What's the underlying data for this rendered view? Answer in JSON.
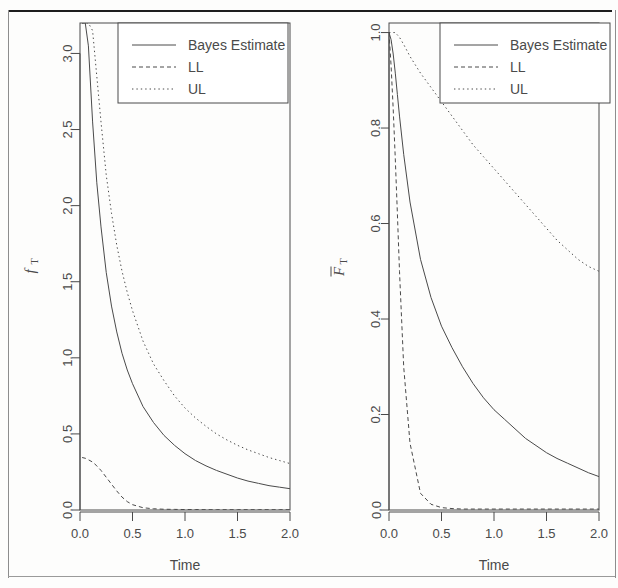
{
  "figure": {
    "kind": "two-panel-statistical-figure",
    "background": "#fdfdfc",
    "ink": "#4a4a4a",
    "panel_count": 2
  },
  "legend": {
    "entries": [
      {
        "label": "Bayes Estimate",
        "style": "solid"
      },
      {
        "label": "LL",
        "style": "dashed"
      },
      {
        "label": "UL",
        "style": "dotted"
      }
    ]
  },
  "chart_data": [
    {
      "id": "left-panel",
      "type": "line",
      "title": "",
      "xlabel": "Time",
      "ylabel": "f_T",
      "ylabel_display": "fT",
      "xlim": [
        0.0,
        2.0
      ],
      "ylim": [
        0.0,
        3.2
      ],
      "xticks": [
        "0.0",
        "0.5",
        "1.0",
        "1.5",
        "2.0"
      ],
      "xtick_values": [
        0.0,
        0.5,
        1.0,
        1.5,
        2.0
      ],
      "yticks": [
        "0.0",
        "0.5",
        "1.0",
        "1.5",
        "2.0",
        "2.5",
        "3.0"
      ],
      "ytick_values": [
        0.0,
        0.5,
        1.0,
        1.5,
        2.0,
        2.5,
        3.0
      ],
      "grid": false,
      "legend_position": "top-right",
      "x": [
        0.02,
        0.05,
        0.08,
        0.12,
        0.16,
        0.2,
        0.25,
        0.3,
        0.35,
        0.4,
        0.45,
        0.5,
        0.6,
        0.7,
        0.8,
        0.9,
        1.0,
        1.1,
        1.2,
        1.3,
        1.4,
        1.5,
        1.6,
        1.7,
        1.8,
        1.9,
        2.0
      ],
      "series": [
        {
          "name": "Bayes Estimate",
          "style": "solid",
          "values": [
            3.2,
            3.2,
            3.05,
            2.55,
            2.15,
            1.86,
            1.56,
            1.34,
            1.17,
            1.03,
            0.92,
            0.83,
            0.68,
            0.575,
            0.49,
            0.425,
            0.37,
            0.325,
            0.29,
            0.26,
            0.235,
            0.21,
            0.19,
            0.175,
            0.16,
            0.15,
            0.14
          ]
        },
        {
          "name": "LL",
          "style": "dashed",
          "values": [
            0.345,
            0.34,
            0.33,
            0.315,
            0.29,
            0.26,
            0.215,
            0.17,
            0.125,
            0.085,
            0.055,
            0.035,
            0.015,
            0.008,
            0.005,
            0.004,
            0.003,
            0.003,
            0.002,
            0.002,
            0.002,
            0.002,
            0.002,
            0.002,
            0.002,
            0.002,
            0.002
          ]
        },
        {
          "name": "UL",
          "style": "dotted",
          "values": [
            3.2,
            3.2,
            3.2,
            3.15,
            2.85,
            2.55,
            2.2,
            1.95,
            1.74,
            1.57,
            1.43,
            1.31,
            1.11,
            0.96,
            0.85,
            0.75,
            0.67,
            0.605,
            0.55,
            0.5,
            0.46,
            0.425,
            0.395,
            0.37,
            0.345,
            0.325,
            0.305
          ]
        }
      ]
    },
    {
      "id": "right-panel",
      "type": "line",
      "title": "",
      "xlabel": "Time",
      "ylabel": "Fbar_T",
      "ylabel_display": "FT",
      "xlim": [
        0.0,
        2.0
      ],
      "ylim": [
        0.0,
        1.02
      ],
      "xticks": [
        "0.0",
        "0.5",
        "1.0",
        "1.5",
        "2.0"
      ],
      "xtick_values": [
        0.0,
        0.5,
        1.0,
        1.5,
        2.0
      ],
      "yticks": [
        "0.0",
        "0.2",
        "0.4",
        "0.6",
        "0.8",
        "1.0"
      ],
      "ytick_values": [
        0.0,
        0.2,
        0.4,
        0.6,
        0.8,
        1.0
      ],
      "grid": false,
      "legend_position": "top-right",
      "x": [
        0.0,
        0.02,
        0.04,
        0.06,
        0.08,
        0.1,
        0.14,
        0.2,
        0.3,
        0.4,
        0.5,
        0.6,
        0.7,
        0.8,
        0.9,
        1.0,
        1.1,
        1.2,
        1.3,
        1.4,
        1.5,
        1.6,
        1.7,
        1.8,
        1.9,
        2.0
      ],
      "series": [
        {
          "name": "Bayes Estimate",
          "style": "solid",
          "values": [
            1.0,
            0.985,
            0.955,
            0.915,
            0.87,
            0.825,
            0.745,
            0.645,
            0.525,
            0.445,
            0.385,
            0.34,
            0.3,
            0.265,
            0.235,
            0.21,
            0.19,
            0.17,
            0.15,
            0.135,
            0.12,
            0.108,
            0.098,
            0.088,
            0.078,
            0.07
          ]
        },
        {
          "name": "LL",
          "style": "dashed",
          "values": [
            1.0,
            0.93,
            0.84,
            0.735,
            0.62,
            0.5,
            0.3,
            0.14,
            0.035,
            0.012,
            0.005,
            0.003,
            0.002,
            0.002,
            0.002,
            0.002,
            0.002,
            0.002,
            0.002,
            0.002,
            0.002,
            0.002,
            0.002,
            0.002,
            0.002,
            0.002
          ]
        },
        {
          "name": "UL",
          "style": "dotted",
          "values": [
            1.0,
            1.0,
            1.0,
            1.0,
            0.995,
            0.99,
            0.975,
            0.95,
            0.915,
            0.885,
            0.855,
            0.825,
            0.795,
            0.765,
            0.74,
            0.715,
            0.69,
            0.665,
            0.64,
            0.615,
            0.59,
            0.565,
            0.545,
            0.525,
            0.51,
            0.5
          ]
        }
      ]
    }
  ]
}
